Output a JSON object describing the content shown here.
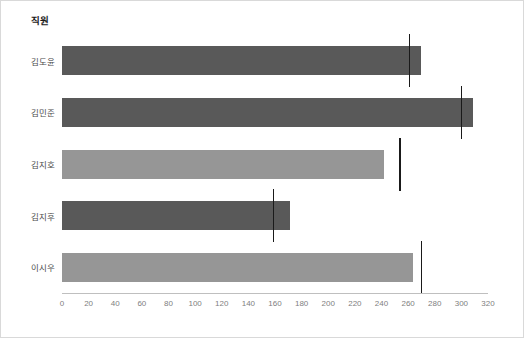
{
  "chart_data": {
    "type": "bar",
    "orientation": "horizontal",
    "title": "직원",
    "xlabel": "",
    "ylabel": "",
    "grid": false,
    "legend": "none",
    "xlim": [
      0,
      320
    ],
    "xticks": [
      0,
      20,
      40,
      60,
      80,
      100,
      120,
      140,
      160,
      180,
      200,
      220,
      240,
      260,
      280,
      300,
      320
    ],
    "categories": [
      "김도윤",
      "김민준",
      "김지호",
      "김지후",
      "이시우"
    ],
    "values": [
      270,
      309,
      242,
      171,
      264
    ],
    "targets": [
      261,
      300,
      254,
      159,
      270
    ],
    "bar_colors": [
      "#595959",
      "#595959",
      "#969696",
      "#595959",
      "#969696"
    ],
    "target_color": "#1a1a1a",
    "series": [
      {
        "name": "실적",
        "values": [
          270,
          309,
          242,
          171,
          264
        ]
      },
      {
        "name": "목표",
        "values": [
          261,
          300,
          254,
          159,
          270
        ]
      }
    ],
    "bars": [
      {
        "category": "김도윤",
        "value": 270,
        "target": 261,
        "color": "#595959"
      },
      {
        "category": "김민준",
        "value": 309,
        "target": 300,
        "color": "#595959"
      },
      {
        "category": "김지호",
        "value": 242,
        "target": 254,
        "color": "#969696"
      },
      {
        "category": "김지후",
        "value": 171,
        "target": 159,
        "color": "#595959"
      },
      {
        "category": "이시우",
        "value": 264,
        "target": 270,
        "color": "#969696"
      }
    ]
  },
  "frame": {
    "border_color": "#d9d9d9",
    "background": "#ffffff",
    "axis_color": "#bfbfbf",
    "tick_text_color": "#808080",
    "category_text_color": "#4d4d4d",
    "title_text_color": "#1a1a1a"
  }
}
